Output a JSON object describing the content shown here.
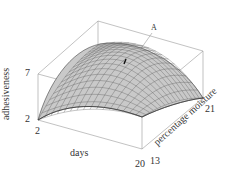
{
  "chart_data": {
    "type": "surface3d",
    "title": "",
    "xlabel": "days",
    "ylabel": "percentage moisture",
    "zlabel": "adhesiveness",
    "x_ticks": [
      "2",
      "20"
    ],
    "y_ticks": [
      "13",
      "21"
    ],
    "z_ticks": [
      "2",
      "7"
    ],
    "xlim": [
      2,
      20
    ],
    "ylim": [
      13,
      21
    ],
    "zlim": [
      2,
      7
    ],
    "annotation": "A",
    "grid": false
  },
  "labels": {
    "z_top": "7",
    "z_bottom": "2",
    "x_left": "2",
    "x_right": "20",
    "y_front": "13",
    "y_back": "21",
    "xlabel": "days",
    "ylabel": "percentage moisture",
    "zlabel": "adhesiveness",
    "annotation": "A"
  }
}
